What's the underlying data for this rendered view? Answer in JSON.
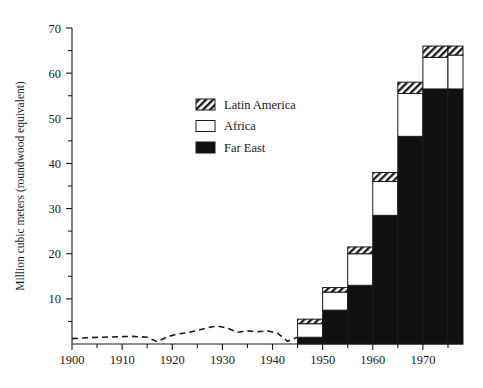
{
  "chart_data": {
    "type": "bar",
    "title": "",
    "subtitle": "",
    "xlabel": "",
    "ylabel": "Million cubic meters (roundwood equivalent)",
    "xlim": [
      1900,
      1978
    ],
    "ylim": [
      0,
      70
    ],
    "grid": false,
    "legend_position": "upper-left-inside",
    "y_ticks_major": [
      0,
      10,
      20,
      30,
      40,
      50,
      60,
      70
    ],
    "y_ticks_major_labels": [
      "",
      "10",
      "20",
      "30",
      "40",
      "50",
      "60",
      "70"
    ],
    "y_ticks_minor": [
      5,
      15,
      25,
      35,
      45,
      55,
      65
    ],
    "x_ticks_major": [
      1900,
      1910,
      1920,
      1930,
      1940,
      1950,
      1960,
      1970
    ],
    "x_ticks_major_labels": [
      "1900",
      "1910",
      "1920",
      "1930",
      "1940",
      "1950",
      "1960",
      "1970"
    ],
    "x_ticks_minor": [
      1905,
      1915,
      1925,
      1935,
      1945,
      1955,
      1965,
      1975
    ],
    "bar_intervals": [
      {
        "start": 1945,
        "end": 1950
      },
      {
        "start": 1950,
        "end": 1955
      },
      {
        "start": 1955,
        "end": 1960
      },
      {
        "start": 1960,
        "end": 1965
      },
      {
        "start": 1965,
        "end": 1970
      },
      {
        "start": 1970,
        "end": 1975
      },
      {
        "start": 1975,
        "end": 1978
      }
    ],
    "categories": [
      "1945-50",
      "1950-55",
      "1955-60",
      "1960-65",
      "1965-70",
      "1970-75",
      "1975-78"
    ],
    "series": [
      {
        "name": "Far East",
        "fill": "solid-black",
        "values": [
          1.5,
          7.5,
          13.0,
          28.5,
          46.0,
          56.5,
          56.5
        ]
      },
      {
        "name": "Africa",
        "fill": "white",
        "values": [
          3.0,
          4.0,
          7.0,
          7.5,
          9.5,
          7.0,
          7.5
        ]
      },
      {
        "name": "Latin America",
        "fill": "hatched",
        "values": [
          1.0,
          1.0,
          1.5,
          2.0,
          2.5,
          2.5,
          2.0
        ]
      }
    ],
    "totals": [
      5.5,
      12.5,
      21.5,
      38.0,
      58.0,
      66.0,
      66.0
    ],
    "dashed_line": {
      "name": "pre-1945 trend",
      "style": "dashed",
      "x": [
        1900,
        1903,
        1906,
        1909,
        1912,
        1915,
        1917,
        1919,
        1921,
        1923,
        1925,
        1927,
        1929,
        1931,
        1933,
        1935,
        1937,
        1939,
        1941,
        1943,
        1945
      ],
      "y": [
        1.2,
        1.4,
        1.5,
        1.6,
        1.7,
        1.5,
        0.5,
        1.6,
        2.2,
        2.5,
        3.0,
        3.6,
        4.0,
        3.5,
        2.6,
        2.9,
        2.7,
        2.9,
        2.4,
        0.6,
        1.5
      ]
    },
    "legend": [
      {
        "label": "Latin America",
        "swatch": "hatched"
      },
      {
        "label": "Africa",
        "swatch": "white"
      },
      {
        "label": "Far East",
        "swatch": "solid-black"
      }
    ],
    "colors": {
      "ink": "#1a1a1a",
      "background": "#ffffff",
      "bar_fill_dark": "#111111",
      "bar_fill_light": "#ffffff"
    }
  }
}
